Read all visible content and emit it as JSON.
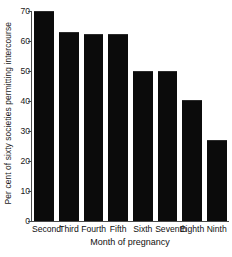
{
  "chart_data": {
    "type": "bar",
    "title": "",
    "xlabel": "Month of pregnancy",
    "ylabel": "Per cent of sixty societies permitting intercourse",
    "categories": [
      "Second",
      "Third",
      "Fourth",
      "Fifth",
      "Sixth",
      "Seventh",
      "Eighth",
      "Ninth"
    ],
    "values": [
      70,
      63,
      62.5,
      62.5,
      50,
      50,
      40.5,
      27
    ],
    "ylim": [
      0,
      70
    ],
    "yticks": [
      0,
      10,
      20,
      30,
      40,
      50,
      60,
      70
    ],
    "ytick_labels": [
      "0",
      "10",
      "20",
      "30",
      "40",
      "50",
      "60",
      "70"
    ],
    "grid": false,
    "legend": false,
    "legend_position": "none",
    "bar_color": "#0b0b0b",
    "axis_color": "#4a4a4a",
    "background_color": "#ffffff"
  }
}
